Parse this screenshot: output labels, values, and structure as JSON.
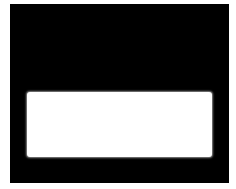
{
  "screen": {
    "background_color": "#000000"
  },
  "panel": {
    "background_color": "#ffffff",
    "text": ""
  }
}
